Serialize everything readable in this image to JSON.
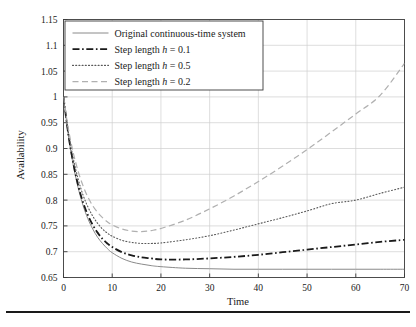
{
  "chart_data": {
    "type": "line",
    "title": "",
    "xlabel": "Time",
    "ylabel": "Availability",
    "xlim": [
      0,
      70
    ],
    "ylim": [
      0.65,
      1.15
    ],
    "xticks": [
      0,
      10,
      20,
      30,
      40,
      50,
      60,
      70
    ],
    "yticks": [
      0.65,
      0.7,
      0.75,
      0.8,
      0.85,
      0.9,
      0.95,
      1,
      1.05,
      1.1,
      1.15
    ],
    "xtick_labels": [
      "0",
      "10",
      "20",
      "30",
      "40",
      "50",
      "60",
      "70"
    ],
    "ytick_labels": [
      "0.65",
      "0.7",
      "0.75",
      "0.8",
      "0.85",
      "0.9",
      "0.95",
      "1",
      "1.05",
      "1.1",
      "1.15"
    ],
    "grid": true,
    "legend_position": "upper-left",
    "series": [
      {
        "name": "Original continuous-time system",
        "style": "solid",
        "color": "#8a8a8a",
        "width": 1.0,
        "x": [
          0,
          1,
          2,
          3,
          4,
          5,
          6,
          7,
          8,
          9,
          10,
          12,
          14,
          16,
          18,
          20,
          25,
          30,
          35,
          40,
          45,
          50,
          55,
          60,
          65,
          70
        ],
        "y": [
          1.0,
          0.925,
          0.868,
          0.824,
          0.79,
          0.764,
          0.744,
          0.728,
          0.716,
          0.706,
          0.698,
          0.687,
          0.68,
          0.676,
          0.673,
          0.671,
          0.668,
          0.667,
          0.666,
          0.666,
          0.666,
          0.666,
          0.666,
          0.666,
          0.666,
          0.666
        ]
      },
      {
        "name": "Step length h = 0.1",
        "label_prefix": "Step length ",
        "label_var": "h",
        "label_value": " = 0.1",
        "style": "dashdot",
        "color": "#1a1a1a",
        "width": 1.8,
        "x": [
          0,
          1,
          2,
          3,
          4,
          5,
          6,
          7,
          8,
          9,
          10,
          12,
          14,
          16,
          18,
          20,
          25,
          30,
          35,
          40,
          45,
          50,
          55,
          60,
          65,
          70
        ],
        "y": [
          1.0,
          0.927,
          0.872,
          0.829,
          0.796,
          0.771,
          0.752,
          0.737,
          0.725,
          0.716,
          0.709,
          0.699,
          0.693,
          0.689,
          0.687,
          0.685,
          0.685,
          0.687,
          0.69,
          0.694,
          0.699,
          0.704,
          0.709,
          0.714,
          0.719,
          0.723
        ]
      },
      {
        "name": "Step length h = 0.5",
        "label_prefix": "Step length ",
        "label_var": "h",
        "label_value": " = 0.5",
        "style": "dotted",
        "color": "#5a5a5a",
        "width": 1.1,
        "x": [
          0,
          1,
          2,
          3,
          4,
          5,
          6,
          7,
          8,
          9,
          10,
          12,
          14,
          16,
          18,
          20,
          25,
          30,
          35,
          40,
          45,
          50,
          55,
          60,
          65,
          70
        ],
        "y": [
          1.0,
          0.932,
          0.881,
          0.841,
          0.81,
          0.787,
          0.769,
          0.755,
          0.744,
          0.736,
          0.73,
          0.722,
          0.718,
          0.716,
          0.716,
          0.717,
          0.723,
          0.731,
          0.742,
          0.754,
          0.766,
          0.779,
          0.793,
          0.8,
          0.813,
          0.825
        ]
      },
      {
        "name": "Step length h = 0.2",
        "label_prefix": "Step length ",
        "label_var": "h",
        "label_value": " = 0.2",
        "style": "dashed",
        "color": "#b0b0b0",
        "width": 1.2,
        "x": [
          0,
          1,
          2,
          3,
          4,
          5,
          6,
          7,
          8,
          9,
          10,
          12,
          14,
          16,
          18,
          20,
          25,
          30,
          35,
          40,
          45,
          50,
          55,
          60,
          65,
          70
        ],
        "y": [
          1.0,
          0.938,
          0.892,
          0.856,
          0.828,
          0.806,
          0.789,
          0.776,
          0.766,
          0.758,
          0.752,
          0.744,
          0.74,
          0.739,
          0.741,
          0.745,
          0.761,
          0.783,
          0.808,
          0.836,
          0.866,
          0.898,
          0.932,
          0.967,
          1.003,
          1.065
        ]
      }
    ]
  },
  "legend": {
    "entries": [
      {
        "label": "Original continuous-time system"
      },
      {
        "label_prefix": "Step length ",
        "var": "h",
        "suffix": " = 0.1"
      },
      {
        "label_prefix": "Step length ",
        "var": "h",
        "suffix": " = 0.5"
      },
      {
        "label_prefix": "Step length ",
        "var": "h",
        "suffix": " = 0.2"
      }
    ]
  },
  "colors": {
    "grid": "#cfcfcf",
    "axis": "#3a3a3a",
    "text": "#1a1a1a",
    "background": "#ffffff",
    "footer_rule": "#1a1a1a"
  }
}
